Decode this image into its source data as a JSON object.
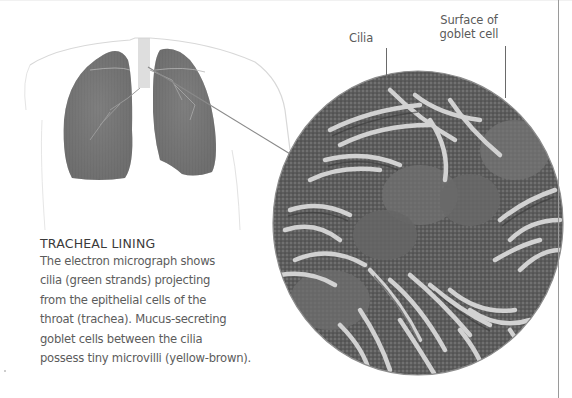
{
  "figure": {
    "labels": {
      "cilia": "Cilia",
      "goblet_line1": "Surface of",
      "goblet_line2": "goblet cell"
    },
    "caption": {
      "title": "TRACHEAL LINING",
      "lines": [
        "The electron micrograph shows",
        "cilia (green strands) projecting",
        "from the epithelial cells of the",
        "throat (trachea). Mucus-secreting",
        "goblet cells between the cilia",
        "possess tiny microvilli (yellow-brown)."
      ]
    },
    "illustrations": {
      "torso": "torso-lungs-illustration",
      "micrograph": "cilia-electron-micrograph"
    },
    "colors": {
      "text": "#5c5c5c",
      "heading": "#3a3a3a",
      "rule": "#9a9a9a",
      "lung": "#6a6a6a"
    }
  }
}
